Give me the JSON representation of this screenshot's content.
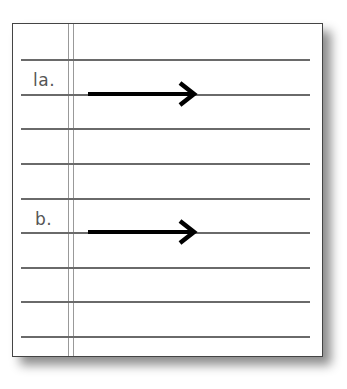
{
  "worksheet": {
    "items": [
      {
        "label": "la.",
        "arrow": "right-arrow"
      },
      {
        "label": "b.",
        "arrow": "right-arrow"
      }
    ],
    "rule_count": 9,
    "colors": {
      "rule": "#6a6a6a",
      "margin": "#999999",
      "arrow": "#000000",
      "label": "#555555"
    }
  }
}
